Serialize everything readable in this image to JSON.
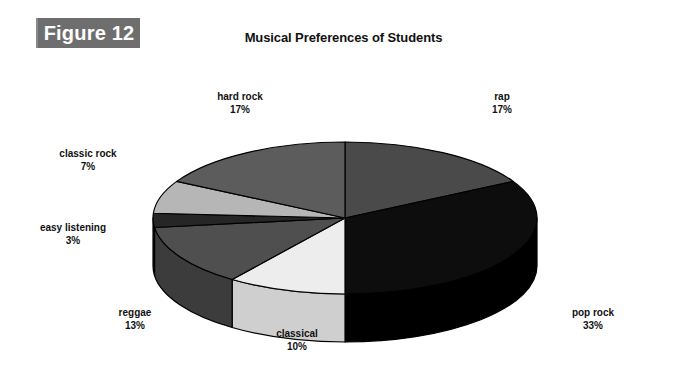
{
  "figure": {
    "tag_label": "Figure 12"
  },
  "chart_data": {
    "type": "pie",
    "title": "Musical Preferences of Students",
    "xlabel": "",
    "ylabel": "",
    "three_d": true,
    "start_angle_deg": 0,
    "direction": "clockwise",
    "categories": [
      "rap",
      "pop rock",
      "classical",
      "reggae",
      "easy listening",
      "classic rock",
      "hard rock"
    ],
    "values": [
      17,
      33,
      10,
      13,
      3,
      7,
      17
    ],
    "value_unit": "%",
    "labels": [
      {
        "name": "rap",
        "pct": "17%",
        "value": 17,
        "color": "#4a4a4a",
        "side_color": "#3a3a3a"
      },
      {
        "name": "pop rock",
        "pct": "33%",
        "value": 33,
        "color": "#0d0d0d",
        "side_color": "#000000"
      },
      {
        "name": "classical",
        "pct": "10%",
        "value": 10,
        "color": "#ededed",
        "side_color": "#cfcfcf"
      },
      {
        "name": "reggae",
        "pct": "13%",
        "value": 13,
        "color": "#4f4f4f",
        "side_color": "#3c3c3c"
      },
      {
        "name": "easy listening",
        "pct": "3%",
        "value": 3,
        "color": "#262626",
        "side_color": "#171717"
      },
      {
        "name": "classic rock",
        "pct": "7%",
        "value": 7,
        "color": "#b6b6b6",
        "side_color": "#9a9a9a"
      },
      {
        "name": "hard rock",
        "pct": "17%",
        "value": 17,
        "color": "#5c5c5c",
        "side_color": "#464646"
      }
    ],
    "legend": "none",
    "legend_position": "labels-outside",
    "grid": false
  },
  "colors": {
    "figure_tag_bg": "#6e6e6e",
    "figure_tag_text": "#ffffff",
    "page_bg": "#ffffff",
    "text": "#111111",
    "outline": "#000000"
  }
}
